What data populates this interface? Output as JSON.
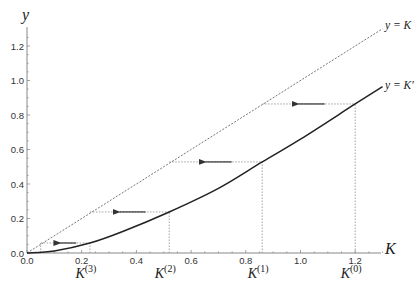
{
  "chart_data": {
    "type": "line",
    "title": "",
    "xlabel": "K",
    "ylabel": "y",
    "xlim": [
      0,
      1.3
    ],
    "ylim": [
      0,
      1.32
    ],
    "x_ticks": [
      "0.0",
      "0.2",
      "0.4",
      "0.6",
      "0.8",
      "1.0",
      "1.2"
    ],
    "y_ticks": [
      "0.0",
      "0.2",
      "0.4",
      "0.6",
      "0.8",
      "1.0",
      "1.2"
    ],
    "grid": false,
    "series": [
      {
        "name": "y = K",
        "style": "dashed",
        "x": [
          0,
          1.3
        ],
        "y": [
          0,
          1.3
        ]
      },
      {
        "name": "y = K'",
        "style": "solid",
        "x": [
          0,
          0.1,
          0.23,
          0.35,
          0.52,
          0.7,
          0.86,
          1.0,
          1.2,
          1.3
        ],
        "y": [
          0,
          0.012,
          0.058,
          0.125,
          0.238,
          0.375,
          0.528,
          0.66,
          0.864,
          0.965
        ]
      }
    ],
    "iterations": [
      {
        "label": "K",
        "sup": "(0)",
        "k": 1.2,
        "next_y": 0.864
      },
      {
        "label": "K",
        "sup": "(1)",
        "k": 0.86,
        "next_y": 0.528
      },
      {
        "label": "K",
        "sup": "(2)",
        "k": 0.52,
        "next_y": 0.238
      },
      {
        "label": "K",
        "sup": "(3)",
        "k": 0.23,
        "next_y": 0.058
      },
      {
        "label": "",
        "sup": "",
        "k": 0.05,
        "next_y": 0.0
      }
    ],
    "annotations": [
      {
        "text": "y = K",
        "near": "end of dashed diagonal"
      },
      {
        "text": "y = K'",
        "near": "end of solid curve"
      },
      {
        "text": "leftward arrows on each horizontal step from y = K' to y = K"
      }
    ]
  },
  "labels": {
    "x_axis": "K",
    "y_axis": "y",
    "line_identity": "y = K",
    "line_curve": "y = K′",
    "iter_base": "K",
    "iter_sups": [
      "(0)",
      "(1)",
      "(2)",
      "(3)"
    ]
  },
  "colors": {
    "axis": "#888888",
    "curve": "#222222",
    "dashed": "#666666",
    "guide": "#999999",
    "arrow": "#333333"
  }
}
